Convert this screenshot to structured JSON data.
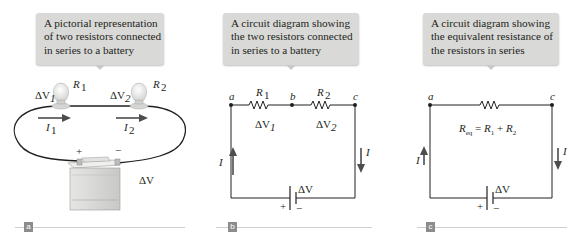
{
  "panels": [
    {
      "id": "a",
      "tag": "a",
      "callout": {
        "lines": [
          "A pictorial representation",
          "of two resistors connected",
          "in series to a battery"
        ]
      },
      "labels": {
        "dv1": "ΔV",
        "dv1_sub": "1",
        "r1": "R",
        "r1_sub": "1",
        "dv2": "ΔV",
        "dv2_sub": "2",
        "r2": "R",
        "r2_sub": "2",
        "i1": "I",
        "i1_sub": "1",
        "i2": "I",
        "i2_sub": "2",
        "plus": "+",
        "minus": "−",
        "dv": "ΔV"
      }
    },
    {
      "id": "b",
      "tag": "b",
      "callout": {
        "lines": [
          "A circuit diagram showing",
          "the two resistors connected",
          "in series to a battery"
        ]
      },
      "labels": {
        "node_a": "a",
        "node_b": "b",
        "node_c": "c",
        "r1": "R",
        "r1_sub": "1",
        "r2": "R",
        "r2_sub": "2",
        "dv1": "ΔV",
        "dv1_sub": "1",
        "dv2": "ΔV",
        "dv2_sub": "2",
        "i_left": "I",
        "i_right": "I",
        "dv": "ΔV",
        "plus": "+",
        "minus": "−"
      }
    },
    {
      "id": "c",
      "tag": "c",
      "callout": {
        "lines": [
          "A circuit diagram showing",
          "the equivalent resistance of",
          "the resistors in series"
        ]
      },
      "labels": {
        "node_a": "a",
        "node_c": "c",
        "req": "R",
        "req_sub": "eq",
        "eq_sign": " = ",
        "r1": "R",
        "r1_sub": "1",
        "plus_sign": " + ",
        "r2": "R",
        "r2_sub": "2",
        "i_left": "I",
        "i_right": "I",
        "dv": "ΔV",
        "plus": "+",
        "minus": "−"
      }
    }
  ],
  "colors": {
    "callout_bg": "#d9d9d7",
    "wire": "#231f20",
    "arrow": "#4d4d4d",
    "tag_bg": "#8c8c8c",
    "divider": "#cfcfcf"
  }
}
